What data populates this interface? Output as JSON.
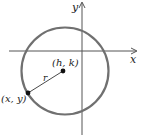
{
  "diagram": {
    "axes": {
      "x_label": "x",
      "y_label": "y"
    },
    "circle": {
      "stroke_color": "#707070"
    },
    "center_point": {
      "label": "(h, k)"
    },
    "point_on_circle": {
      "label": "(x, y)"
    },
    "radius": {
      "label": "r"
    }
  }
}
